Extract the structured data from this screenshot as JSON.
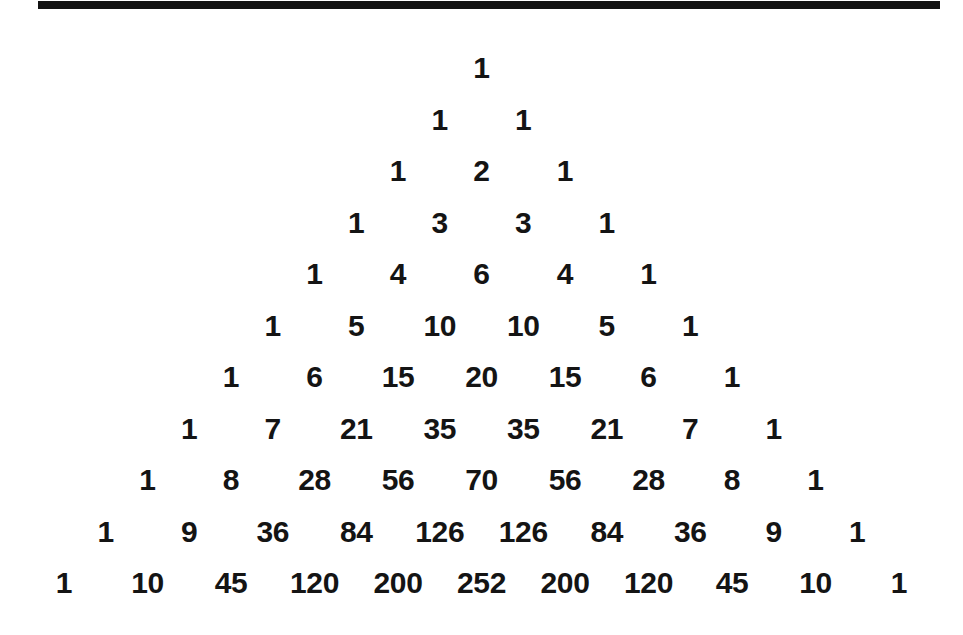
{
  "page": {
    "background_color": "#ffffff",
    "text_color": "#141414",
    "rule_color": "#121212"
  },
  "top_rule": {
    "name": "horizontal-rule"
  },
  "chart_data": {
    "type": "table",
    "xlabel": "",
    "ylabel": "",
    "layout": "centered-pyramid",
    "row_count": 11,
    "grid": false,
    "legend": null,
    "rows": [
      [
        "1"
      ],
      [
        "1",
        "1"
      ],
      [
        "1",
        "2",
        "1"
      ],
      [
        "1",
        "3",
        "3",
        "1"
      ],
      [
        "1",
        "4",
        "6",
        "4",
        "1"
      ],
      [
        "1",
        "5",
        "10",
        "10",
        "5",
        "1"
      ],
      [
        "1",
        "6",
        "15",
        "20",
        "15",
        "6",
        "1"
      ],
      [
        "1",
        "7",
        "21",
        "35",
        "35",
        "21",
        "7",
        "1"
      ],
      [
        "1",
        "8",
        "28",
        "56",
        "70",
        "56",
        "28",
        "8",
        "1"
      ],
      [
        "1",
        "9",
        "36",
        "84",
        "126",
        "126",
        "84",
        "36",
        "9",
        "1"
      ],
      [
        "1",
        "10",
        "45",
        "120",
        "200",
        "252",
        "200",
        "120",
        "45",
        "10",
        "1"
      ]
    ]
  }
}
